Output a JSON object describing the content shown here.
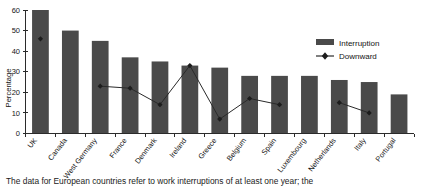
{
  "chart_data": {
    "type": "bar",
    "title": "",
    "xlabel": "",
    "ylabel": "Percentage",
    "ylim": [
      0,
      60
    ],
    "yticks": [
      0,
      10,
      20,
      30,
      40,
      50,
      60
    ],
    "ytick_labels": [
      "0",
      "10",
      "20",
      "30",
      "40",
      "50",
      "60"
    ],
    "grid": false,
    "legend_position": "upper-right",
    "categories": [
      "UK",
      "Canada",
      "West Germany",
      "France",
      "Denmark",
      "Ireland",
      "Greece",
      "Belgium",
      "Spain",
      "Luxembourg",
      "Netherlands",
      "Italy",
      "Portugal"
    ],
    "series": [
      {
        "name": "Interruption",
        "kind": "bar",
        "color": "#4a4a4a",
        "values": [
          60,
          50,
          45,
          37,
          35,
          33,
          32,
          28,
          28,
          28,
          26,
          25,
          19
        ]
      },
      {
        "name": "Downward",
        "kind": "line",
        "color": "#2a2a2a",
        "marker": "filled-diamond",
        "values": [
          46,
          null,
          23,
          22,
          14,
          33,
          7,
          17,
          14,
          null,
          15,
          10,
          null
        ]
      }
    ]
  },
  "legend": {
    "items": [
      {
        "label": "Interruption",
        "type": "swatch",
        "color": "#4a4a4a"
      },
      {
        "label": "Downward",
        "type": "line-marker",
        "color": "#2a2a2a"
      }
    ]
  },
  "caption": {
    "text": "The data for European countries refer to work interruptions of at least one year; the"
  }
}
